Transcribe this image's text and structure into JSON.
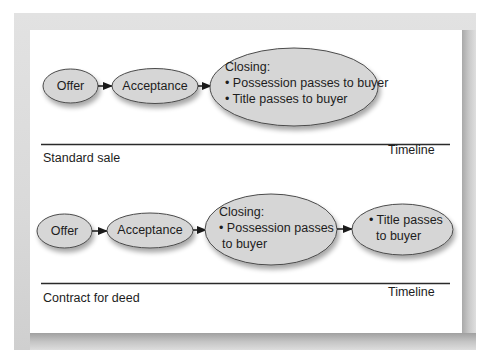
{
  "figure": {
    "sections": [
      {
        "name": "Standard sale",
        "timeline_label": "Timeline",
        "nodes": [
          {
            "id": "offer",
            "label": "Offer"
          },
          {
            "id": "acceptance",
            "label": "Acceptance"
          },
          {
            "id": "closing",
            "title": "Closing:",
            "bullets": [
              "• Possession passes to buyer",
              "• Title passes to buyer"
            ]
          }
        ]
      },
      {
        "name": "Contract for deed",
        "timeline_label": "Timeline",
        "nodes": [
          {
            "id": "offer",
            "label": "Offer"
          },
          {
            "id": "acceptance",
            "label": "Acceptance"
          },
          {
            "id": "closing",
            "title": "Closing:",
            "lines": [
              "• Possession passes",
              "to buyer"
            ]
          },
          {
            "id": "title-transfer",
            "lines": [
              "• Title passes",
              "to buyer"
            ]
          }
        ]
      }
    ],
    "colors": {
      "node_fill": "#d6d6d6",
      "node_stroke": "#4a4a4a",
      "line": "#2a2a2a",
      "frame": "#d9d9d9"
    }
  }
}
